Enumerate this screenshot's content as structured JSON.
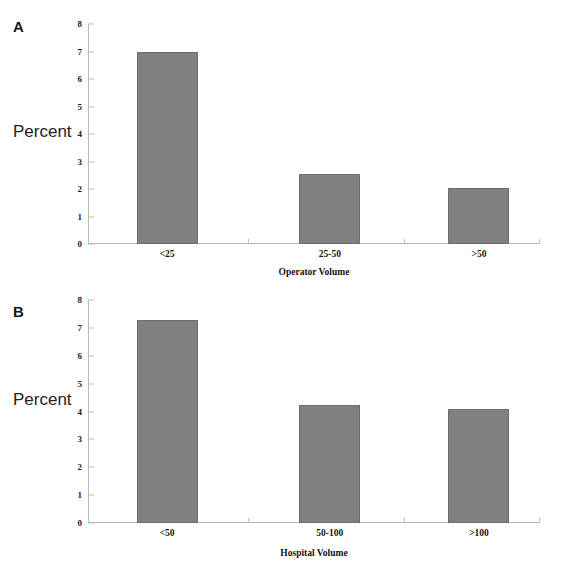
{
  "figure": {
    "background": "#ffffff",
    "bar_color": "#808080",
    "bar_edge_color": "#6e6e6e",
    "axis_color": "#b9b9b9",
    "text_color": "#151515"
  },
  "panels": [
    {
      "letter": "A",
      "ylabel": "Percent",
      "xlabel": "Operator Volume"
    },
    {
      "letter": "B",
      "ylabel": "Percent",
      "xlabel": "Hospital Volume"
    }
  ],
  "chart_data": [
    {
      "type": "bar",
      "panel": "A",
      "title": "",
      "xlabel": "Operator Volume",
      "ylabel": "Percent",
      "categories": [
        "<25",
        "25-50",
        ">50"
      ],
      "values": [
        7.0,
        2.55,
        2.02
      ],
      "ylim": [
        0,
        8
      ],
      "yticks": [
        0,
        1,
        2,
        3,
        4,
        5,
        6,
        7,
        8
      ],
      "ytick_labels": [
        "0",
        "1",
        "2",
        "3",
        "4",
        "5",
        "6",
        "7",
        "8"
      ],
      "grid": false,
      "legend": false
    },
    {
      "type": "bar",
      "panel": "B",
      "title": "",
      "xlabel": "Hospital Volume",
      "ylabel": "Percent",
      "categories": [
        "<50",
        "50-100",
        ">100"
      ],
      "values": [
        7.3,
        4.25,
        4.1
      ],
      "ylim": [
        0,
        8
      ],
      "yticks": [
        0,
        1,
        2,
        3,
        4,
        5,
        6,
        7,
        8
      ],
      "ytick_labels": [
        "0",
        "1",
        "2",
        "3",
        "4",
        "5",
        "6",
        "7",
        "8"
      ],
      "grid": false,
      "legend": false
    }
  ]
}
